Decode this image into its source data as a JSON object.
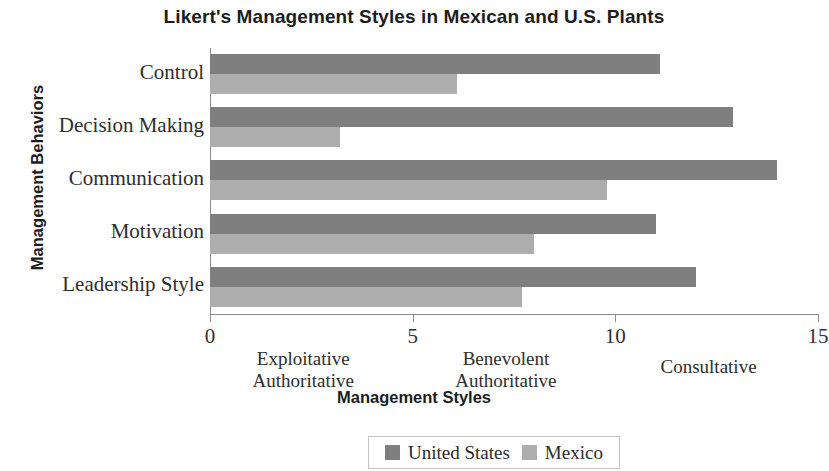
{
  "chart_data": {
    "type": "bar",
    "orientation": "horizontal",
    "title": "Likert's Management Styles in Mexican and U.S. Plants",
    "xlabel": "Management Styles",
    "ylabel": "Management Behaviors",
    "categories": [
      "Control",
      "Decision Making",
      "Communication",
      "Motivation",
      "Leadership Style"
    ],
    "series": [
      {
        "name": "United States",
        "color": "#7f7f7f",
        "values": [
          11.1,
          12.9,
          14.0,
          11.0,
          12.0
        ]
      },
      {
        "name": "Mexico",
        "color": "#adadad",
        "values": [
          6.1,
          3.2,
          9.8,
          8.0,
          7.7
        ]
      }
    ],
    "xlim": [
      0,
      15
    ],
    "xticks": [
      0,
      5,
      10,
      15
    ],
    "xtick_labels": [
      "0",
      "5",
      "10",
      "15"
    ],
    "x_band_labels": [
      {
        "text": "Exploitative\nAuthoritative",
        "at": 2.3
      },
      {
        "text": "Benevolent\nAuthoritative",
        "at": 7.3
      },
      {
        "text": "Consultative",
        "at": 12.3
      }
    ],
    "grid": false,
    "legend_position": "bottom-center"
  },
  "legend": {
    "entries": [
      {
        "label": "United States",
        "color": "#7f7f7f"
      },
      {
        "label": "Mexico",
        "color": "#adadad"
      }
    ]
  }
}
